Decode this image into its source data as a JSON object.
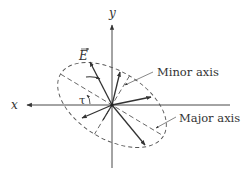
{
  "diagram": {
    "labels": {
      "x_axis": "x",
      "y_axis": "y",
      "field_vector": "E",
      "tilt_angle": "τ",
      "minor_axis": "Minor axis",
      "major_axis": "Major axis"
    },
    "origin": [
      112,
      105
    ],
    "tilt_angle_deg": 31,
    "ellipse": {
      "semi_major": 60,
      "semi_minor": 34,
      "style": "dashed"
    },
    "vectors_count": 6,
    "colors": {
      "line": "#333333",
      "background": "#ffffff"
    }
  }
}
